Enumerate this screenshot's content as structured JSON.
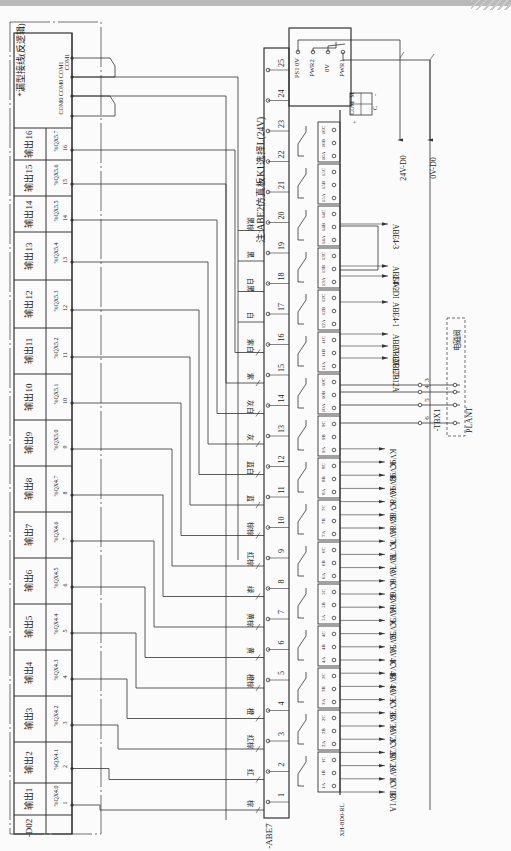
{
  "header": {
    "note_top": "*漏型接线(反逻辑)",
    "note_board": "注:ABE2仿真板K1选择L(24V)"
  },
  "module_do2": {
    "id": "-D02",
    "outputs": [
      {
        "label": "输出1",
        "addr": "%QX4.0",
        "pin": "1"
      },
      {
        "label": "输出2",
        "addr": "%QX4.1",
        "pin": "2"
      },
      {
        "label": "输出3",
        "addr": "%QX4.2",
        "pin": "3"
      },
      {
        "label": "输出4",
        "addr": "%QX4.3",
        "pin": "4"
      },
      {
        "label": "输出5",
        "addr": "%QX4.4",
        "pin": "5"
      },
      {
        "label": "输出6",
        "addr": "%QX4.5",
        "pin": "6"
      },
      {
        "label": "输出7",
        "addr": "%QX4.6",
        "pin": "7"
      },
      {
        "label": "输出8",
        "addr": "%QX4.7",
        "pin": "8"
      },
      {
        "label": "输出9",
        "addr": "%QX5.0",
        "pin": "9"
      },
      {
        "label": "输出10",
        "addr": "%QX5.1",
        "pin": "10"
      },
      {
        "label": "输出11",
        "addr": "%QX5.2",
        "pin": "11"
      },
      {
        "label": "输出12",
        "addr": "%QX5.3",
        "pin": "12"
      },
      {
        "label": "输出13",
        "addr": "%QX5.4",
        "pin": "13"
      },
      {
        "label": "输出14",
        "addr": "%QX5.5",
        "pin": "14"
      },
      {
        "label": "输出15",
        "addr": "%QX5.6",
        "pin": "15"
      },
      {
        "label": "输出16",
        "addr": "%QX5.7",
        "pin": "16"
      }
    ],
    "com_terminals": [
      "COM0",
      "COM0",
      "COM1",
      "COM1"
    ]
  },
  "wire_colors": [
    "棕",
    "红",
    "红棕",
    "橙",
    "橙棕",
    "黄",
    "黄棕",
    "绿",
    "红棕",
    "棕棕",
    "蓝",
    "蓝白",
    "灰",
    "灰白",
    "紫",
    "紫白",
    "白",
    "白黑",
    "黑",
    "黑棕"
  ],
  "abe7": {
    "id": "-ABE7",
    "model": "XH-8D0-RL",
    "terminals": [
      "1",
      "2",
      "3",
      "4",
      "5",
      "6",
      "7",
      "8",
      "9",
      "10",
      "11",
      "12",
      "13",
      "14",
      "15",
      "16",
      "17",
      "18",
      "19",
      "20",
      "21",
      "22",
      "23",
      "24",
      "25"
    ],
    "relays": [
      [
        "1A",
        "1B",
        "1C"
      ],
      [
        "2A",
        "2B",
        "2C"
      ],
      [
        "3A",
        "3B",
        "3C"
      ],
      [
        "4A",
        "4B",
        "4C"
      ],
      [
        "5A",
        "5B",
        "5C"
      ],
      [
        "6A",
        "6B",
        "6C"
      ],
      [
        "7A",
        "7B",
        "7C"
      ],
      [
        "8A",
        "8B",
        "8C"
      ],
      [
        "9A",
        "9B",
        "9C"
      ],
      [
        "10A",
        "10B",
        "10C"
      ],
      [
        "11A",
        "11B",
        "11C"
      ],
      [
        "12A",
        "12B",
        "12C"
      ],
      [
        "13A",
        "13B",
        "13C"
      ],
      [
        "14A",
        "14B",
        "14C"
      ],
      [
        "15A",
        "15B",
        "15C"
      ],
      [
        "16A",
        "16B",
        "16C"
      ]
    ],
    "power_terminals": [
      "PS1 0V",
      "PWR2",
      "0V",
      "PWR1"
    ],
    "com_block": [
      "COM",
      "M",
      "+",
      "C",
      "-"
    ]
  },
  "kv_outputs": [
    "KV1A",
    "KV1B",
    "KV1C",
    "KV2A",
    "KV2B",
    "KV2C",
    "KV3A",
    "KV3B",
    "KV3C",
    "KV4A",
    "KV4B",
    "KV4C",
    "KV5A",
    "KV5B",
    "KV5C",
    "KV6A",
    "KV6B",
    "KV6C",
    "KV7A",
    "KV7B",
    "KV7C",
    "KV8A",
    "KV8B",
    "KV8C",
    "KV9A",
    "KV9B",
    "KV9C"
  ],
  "right_signals": [
    "ABE7-12A",
    "ABE7-12B",
    "ABE7-12C",
    "ABE4-1",
    "24V-DI",
    "ABE4-2",
    "ABE4-3"
  ],
  "power_lines": [
    "24V-D0",
    "0V-D0"
  ],
  "tbx1": {
    "id": "-TBX1",
    "pins": [
      "3",
      "4",
      "5",
      "6"
    ]
  },
  "plant": {
    "id": "PLANT",
    "device": "电磁阀"
  }
}
